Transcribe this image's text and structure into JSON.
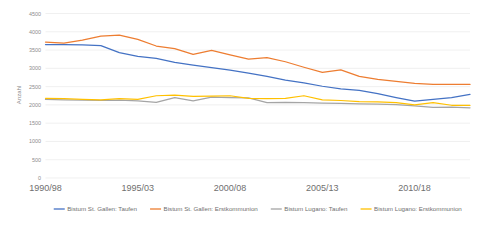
{
  "chart_data": {
    "type": "line",
    "title": "",
    "xlabel": "",
    "ylabel": "Anzahl",
    "ylim": [
      0,
      4500
    ],
    "ytick_step": 500,
    "grid": true,
    "legend_position": "bottom",
    "ytick_labels": [
      "4500",
      "4000",
      "3500",
      "3000",
      "2500",
      "2000",
      "1500",
      "1000",
      "500",
      "0"
    ],
    "xtick_labels": [
      "1990/98",
      "1995/03",
      "2000/08",
      "2005/13",
      "2010/18"
    ],
    "xtick_indices": [
      0,
      5,
      10,
      15,
      20
    ],
    "x": [
      "1990/98",
      "1991/99",
      "1992/00",
      "1993/01",
      "1994/02",
      "1995/03",
      "1996/04",
      "1997/05",
      "1998/06",
      "1999/07",
      "2000/08",
      "2001/09",
      "2002/10",
      "2003/11",
      "2004/12",
      "2005/13",
      "2006/14",
      "2007/15",
      "2008/16",
      "2009/17",
      "2010/18",
      "2011/19",
      "2012/20",
      "2013/21"
    ],
    "series": [
      {
        "name": "Bistum St. Gallen: Taufen",
        "color": "#4472C4",
        "values": [
          3650,
          3650,
          3640,
          3620,
          3430,
          3330,
          3270,
          3160,
          3090,
          3020,
          2950,
          2870,
          2780,
          2680,
          2600,
          2510,
          2440,
          2400,
          2310,
          2200,
          2100,
          2150,
          2200,
          2290
        ]
      },
      {
        "name": "Bistum St. Gallen: Erstkommunion",
        "color": "#ED7D31",
        "values": [
          3720,
          3690,
          3770,
          3880,
          3910,
          3790,
          3610,
          3540,
          3380,
          3490,
          3370,
          3250,
          3290,
          3180,
          3030,
          2890,
          2960,
          2780,
          2700,
          2640,
          2590,
          2560,
          2560,
          2560
        ]
      },
      {
        "name": "Bistum Lugano: Taufen",
        "color": "#A5A5A5",
        "values": [
          2150,
          2140,
          2130,
          2120,
          2130,
          2110,
          2070,
          2200,
          2110,
          2210,
          2200,
          2190,
          2060,
          2070,
          2060,
          2050,
          2040,
          2030,
          2020,
          2010,
          1970,
          1930,
          1940,
          1920
        ]
      },
      {
        "name": "Bistum Lugano: Erstkommunion",
        "color": "#FFC000",
        "values": [
          2180,
          2170,
          2150,
          2140,
          2170,
          2150,
          2250,
          2270,
          2230,
          2240,
          2250,
          2180,
          2170,
          2180,
          2250,
          2140,
          2120,
          2090,
          2080,
          2060,
          2000,
          2060,
          1990,
          1990
        ]
      }
    ]
  }
}
